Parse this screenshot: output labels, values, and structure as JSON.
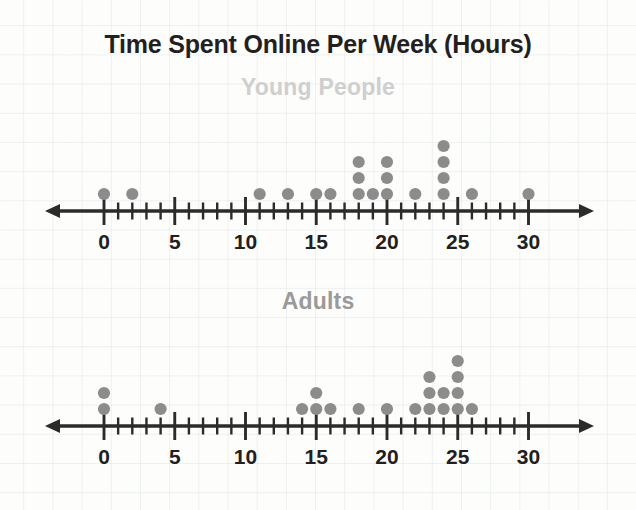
{
  "chart_data": {
    "type": "scatter",
    "title": "Time Spent Online Per Week (Hours)",
    "xlabel": "",
    "ylabel": "",
    "xlim": [
      0,
      30
    ],
    "tick_labels": [
      "0",
      "5",
      "10",
      "15",
      "20",
      "25",
      "30"
    ],
    "tick_values": [
      0,
      5,
      10,
      15,
      20,
      25,
      30
    ],
    "minor_tick_step": 1,
    "major_tick_step": 5,
    "grid": false,
    "legend": "none",
    "dot_color": "#8c8c8c",
    "axis_color": "#2b2b2b",
    "plots": [
      {
        "name": "Young People",
        "subtitle": "Young People",
        "subtitle_color": "#cfcfcf",
        "values": [
          0,
          2,
          11,
          13,
          15,
          16,
          18,
          18,
          18,
          19,
          20,
          20,
          20,
          22,
          24,
          24,
          24,
          24,
          26,
          30
        ],
        "counts": [
          {
            "x": 0,
            "n": 1
          },
          {
            "x": 2,
            "n": 1
          },
          {
            "x": 11,
            "n": 1
          },
          {
            "x": 13,
            "n": 1
          },
          {
            "x": 15,
            "n": 1
          },
          {
            "x": 16,
            "n": 1
          },
          {
            "x": 18,
            "n": 3
          },
          {
            "x": 19,
            "n": 1
          },
          {
            "x": 20,
            "n": 3
          },
          {
            "x": 22,
            "n": 1
          },
          {
            "x": 24,
            "n": 4
          },
          {
            "x": 26,
            "n": 1
          },
          {
            "x": 30,
            "n": 1
          }
        ],
        "total": 20
      },
      {
        "name": "Adults",
        "subtitle": "Adults",
        "subtitle_color": "#9a9a9a",
        "values": [
          0,
          0,
          4,
          14,
          15,
          15,
          16,
          18,
          20,
          22,
          23,
          23,
          23,
          24,
          24,
          25,
          25,
          25,
          25,
          26
        ],
        "counts": [
          {
            "x": 0,
            "n": 2
          },
          {
            "x": 4,
            "n": 1
          },
          {
            "x": 14,
            "n": 1
          },
          {
            "x": 15,
            "n": 2
          },
          {
            "x": 16,
            "n": 1
          },
          {
            "x": 18,
            "n": 1
          },
          {
            "x": 20,
            "n": 1
          },
          {
            "x": 22,
            "n": 1
          },
          {
            "x": 23,
            "n": 3
          },
          {
            "x": 24,
            "n": 2
          },
          {
            "x": 25,
            "n": 4
          },
          {
            "x": 26,
            "n": 1
          }
        ],
        "total": 20
      }
    ]
  }
}
